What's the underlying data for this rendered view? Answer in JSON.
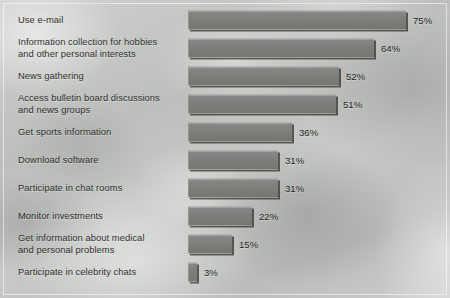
{
  "chart_data": {
    "type": "bar",
    "orientation": "horizontal",
    "title": "",
    "xlabel": "",
    "ylabel": "",
    "xlim": [
      0,
      80
    ],
    "grid": false,
    "legend": null,
    "value_suffix": "%",
    "categories": [
      "Use e-mail",
      "Information collection for hobbies and other personal interests",
      "News gathering",
      "Access bulletin board discussions and news groups",
      "Get sports information",
      "Download software",
      "Participate in chat rooms",
      "Monitor investments",
      "Get information about medical and personal problems",
      "Participate in celebrity chats"
    ],
    "values": [
      75,
      64,
      52,
      51,
      36,
      31,
      31,
      22,
      15,
      3
    ],
    "value_labels": [
      "75%",
      "64%",
      "52%",
      "51%",
      "36%",
      "31%",
      "31%",
      "22%",
      "15%",
      "3%"
    ]
  },
  "rows": [
    {
      "label_line1": "Use e-mail",
      "label_line2": "",
      "value": 75,
      "value_label": "75%"
    },
    {
      "label_line1": "Information collection for hobbies",
      "label_line2": "and other personal interests",
      "value": 64,
      "value_label": "64%"
    },
    {
      "label_line1": "News gathering",
      "label_line2": "",
      "value": 52,
      "value_label": "52%"
    },
    {
      "label_line1": "Access bulletin board discussions",
      "label_line2": "and news groups",
      "value": 51,
      "value_label": "51%"
    },
    {
      "label_line1": "Get sports information",
      "label_line2": "",
      "value": 36,
      "value_label": "36%"
    },
    {
      "label_line1": "Download software",
      "label_line2": "",
      "value": 31,
      "value_label": "31%"
    },
    {
      "label_line1": "Participate in chat rooms",
      "label_line2": "",
      "value": 31,
      "value_label": "31%"
    },
    {
      "label_line1": "Monitor investments",
      "label_line2": "",
      "value": 22,
      "value_label": "22%"
    },
    {
      "label_line1": "Get information about medical",
      "label_line2": "and personal problems",
      "value": 15,
      "value_label": "15%"
    },
    {
      "label_line1": "Participate in celebrity chats",
      "label_line2": "",
      "value": 3,
      "value_label": "3%"
    }
  ],
  "style": {
    "bar_color": "#7b7e7a",
    "bar_shadow_color": "#141414",
    "text_color": "#2f2f2f",
    "background_color": "#c5c7c4"
  },
  "layout": {
    "bar_origin_x": 188,
    "px_per_percent": 2.9,
    "row_pitch": 28,
    "first_row_top": 6,
    "bar_height": 19
  }
}
